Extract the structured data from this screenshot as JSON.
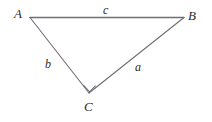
{
  "diagram": {
    "type": "right-triangle",
    "background_color": "#ffffff",
    "stroke_color": "#6e6e73",
    "text_color": "#2b2b2b",
    "stroke_width": 1.1,
    "vertices": [
      {
        "name": "A",
        "label": "A",
        "x": 30,
        "y": 17
      },
      {
        "name": "B",
        "label": "B",
        "x": 184,
        "y": 17
      },
      {
        "name": "C",
        "label": "C",
        "x": 89,
        "y": 93
      }
    ],
    "sides": [
      {
        "name": "a",
        "label": "a",
        "from": "C",
        "to": "B",
        "label_x": 139,
        "label_y": 67
      },
      {
        "name": "b",
        "label": "b",
        "from": "A",
        "to": "C",
        "label_x": 49,
        "label_y": 64
      },
      {
        "name": "c",
        "label": "c",
        "from": "A",
        "to": "B",
        "label_x": 107,
        "label_y": 10
      }
    ],
    "right_angle": {
      "at_vertex": "C",
      "marker": "square",
      "size": 9
    },
    "edge_paths": {
      "AB": "M 30 17 L 184 17",
      "AC": "M 30 17 L 89 93",
      "CB": "M 89 93 L 184 17",
      "right_angle_marker": "M 83.3 85.0 L 89.4 91.6 L 95.5 85.5"
    }
  }
}
